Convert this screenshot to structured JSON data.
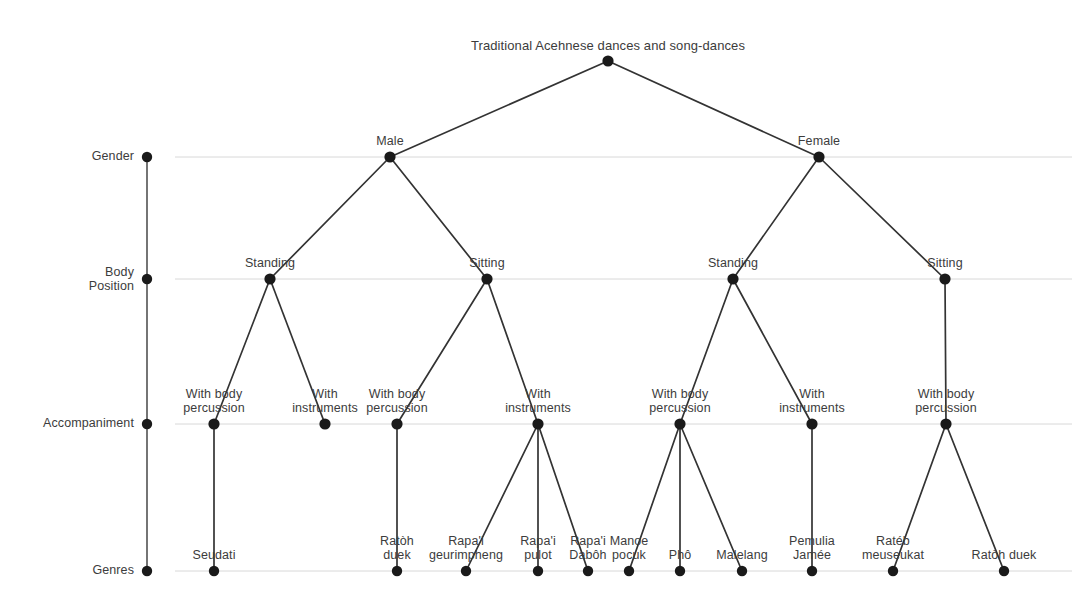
{
  "figure": {
    "title": "Traditional Acehnese dances and song-dances",
    "type": "dendrogram",
    "background_color": "#ffffff",
    "node_color": "#1a1a1a",
    "link_color": "#333333",
    "gridline_color": "#d8d8d8",
    "text_color": "#3c3c3c"
  },
  "axis": {
    "name": "hierarchy-levels",
    "levels": [
      {
        "id": "gender",
        "label": "Gender",
        "y": 157
      },
      {
        "id": "body_position",
        "label": "Body\nPosition",
        "y": 279
      },
      {
        "id": "accompaniment",
        "label": "Accompaniment",
        "y": 424
      },
      {
        "id": "genres",
        "label": "Genres",
        "y": 571
      }
    ],
    "spine_x": 147,
    "spine_top": 157,
    "spine_bottom": 571
  },
  "chart_data": {
    "type": "tree",
    "title": "Traditional Acehnese dances and song-dances",
    "root": {
      "label": "Traditional Acehnese dances and song-dances",
      "x": 608,
      "y": 61,
      "level": "root"
    },
    "nodes": [
      {
        "id": "root",
        "label": "Traditional Acehnese dances and song-dances",
        "level": "root",
        "x": 608,
        "y": 61,
        "parent": null,
        "label_pos": "above"
      },
      {
        "id": "male",
        "label": "Male",
        "level": "gender",
        "x": 390,
        "y": 157,
        "parent": "root",
        "label_pos": "above"
      },
      {
        "id": "female",
        "label": "Female",
        "level": "gender",
        "x": 819,
        "y": 157,
        "parent": "root",
        "label_pos": "above"
      },
      {
        "id": "male_standing",
        "label": "Standing",
        "level": "body_position",
        "x": 270,
        "y": 279,
        "parent": "male",
        "label_pos": "above"
      },
      {
        "id": "male_sitting",
        "label": "Sitting",
        "level": "body_position",
        "x": 487,
        "y": 279,
        "parent": "male",
        "label_pos": "above"
      },
      {
        "id": "female_standing",
        "label": "Standing",
        "level": "body_position",
        "x": 733,
        "y": 279,
        "parent": "female",
        "label_pos": "above"
      },
      {
        "id": "female_sitting",
        "label": "Sitting",
        "level": "body_position",
        "x": 945,
        "y": 279,
        "parent": "female",
        "label_pos": "above"
      },
      {
        "id": "ms_body",
        "label": "With body\npercussion",
        "level": "accompaniment",
        "x": 214,
        "y": 424,
        "parent": "male_standing",
        "label_pos": "above"
      },
      {
        "id": "ms_instr",
        "label": "With\ninstruments",
        "level": "accompaniment",
        "x": 325,
        "y": 424,
        "parent": "male_standing",
        "label_pos": "above"
      },
      {
        "id": "msit_body",
        "label": "With body\npercussion",
        "level": "accompaniment",
        "x": 397,
        "y": 424,
        "parent": "male_sitting",
        "label_pos": "above"
      },
      {
        "id": "msit_instr",
        "label": "With\ninstruments",
        "level": "accompaniment",
        "x": 538,
        "y": 424,
        "parent": "male_sitting",
        "label_pos": "above"
      },
      {
        "id": "fs_body",
        "label": "With body\npercussion",
        "level": "accompaniment",
        "x": 680,
        "y": 424,
        "parent": "female_standing",
        "label_pos": "above"
      },
      {
        "id": "fs_instr",
        "label": "With\ninstruments",
        "level": "accompaniment",
        "x": 812,
        "y": 424,
        "parent": "female_standing",
        "label_pos": "above"
      },
      {
        "id": "fsit_body",
        "label": "With body\npercussion",
        "level": "accompaniment",
        "x": 946,
        "y": 424,
        "parent": "female_sitting",
        "label_pos": "above"
      },
      {
        "id": "g_seudati",
        "label": "Seudati",
        "level": "genres",
        "x": 214,
        "y": 571,
        "parent": "ms_body",
        "label_pos": "above"
      },
      {
        "id": "g_ratoh_duek_1",
        "label": "Ratòh\nduek",
        "level": "genres",
        "x": 397,
        "y": 571,
        "parent": "msit_body",
        "label_pos": "above"
      },
      {
        "id": "g_rapai_geurimpheng",
        "label": "Rapa'i\ngeurimpheng",
        "level": "genres",
        "x": 466,
        "y": 571,
        "parent": "msit_instr",
        "label_pos": "above"
      },
      {
        "id": "g_rapai_pulot",
        "label": "Rapa'i\npulot",
        "level": "genres",
        "x": 538,
        "y": 571,
        "parent": "msit_instr",
        "label_pos": "above"
      },
      {
        "id": "g_rapai_daboh",
        "label": "Rapa'i\nDabôh",
        "level": "genres",
        "x": 588,
        "y": 571,
        "parent": "msit_instr",
        "label_pos": "above"
      },
      {
        "id": "g_manoe_pocuk",
        "label": "Manoe\npocuk",
        "level": "genres",
        "x": 629,
        "y": 571,
        "parent": "fs_body",
        "label_pos": "above"
      },
      {
        "id": "g_pho",
        "label": "Phô",
        "level": "genres",
        "x": 680,
        "y": 571,
        "parent": "fs_body",
        "label_pos": "above"
      },
      {
        "id": "g_malelang",
        "label": "Malelang",
        "level": "genres",
        "x": 742,
        "y": 571,
        "parent": "fs_body",
        "label_pos": "above"
      },
      {
        "id": "g_pemulia_jamee",
        "label": "Pemulia\nJamée",
        "level": "genres",
        "x": 812,
        "y": 571,
        "parent": "fs_instr",
        "label_pos": "above"
      },
      {
        "id": "g_rateb_meuseukat",
        "label": "Ratéb\nmeuseukat",
        "level": "genres",
        "x": 893,
        "y": 571,
        "parent": "fsit_body",
        "label_pos": "above"
      },
      {
        "id": "g_ratoh_duek_2",
        "label": "Ratòh duek",
        "level": "genres",
        "x": 1004,
        "y": 571,
        "parent": "fsit_body",
        "label_pos": "above"
      }
    ],
    "genre_count": 11,
    "genres": [
      "Seudati",
      "Ratòh duek",
      "Rapa'i geurimpheng",
      "Rapa'i pulot",
      "Rapa'i Dabôh",
      "Manoe pocuk",
      "Phô",
      "Malelang",
      "Pemulia Jamée",
      "Ratéb meuseukat",
      "Ratòh duek"
    ],
    "axis_levels": [
      "Gender",
      "Body Position",
      "Accompaniment",
      "Genres"
    ],
    "gridlines": true,
    "legend": null
  }
}
